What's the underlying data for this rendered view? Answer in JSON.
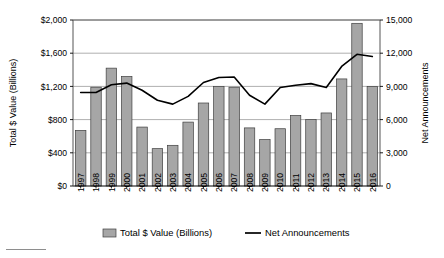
{
  "chart_data": {
    "type": "bar",
    "title": "",
    "subtitle": "",
    "xlabel": "",
    "ylabel": "Total $ Value (Billions)",
    "y2label": "Net Announcements",
    "grid": true,
    "legend_position": "bottom",
    "categories": [
      "1997",
      "1998",
      "1999",
      "2000",
      "2001",
      "2002",
      "2003",
      "2004",
      "2005",
      "2006",
      "2007",
      "2008",
      "2009",
      "2010",
      "2011",
      "2012",
      "2013",
      "2014",
      "2015",
      "2016"
    ],
    "ylim": [
      0,
      2000
    ],
    "yticks": [
      0,
      400,
      800,
      1200,
      1600,
      2000
    ],
    "ytick_labels": [
      "$0",
      "$400",
      "$800",
      "$1,200",
      "$1,600",
      "$2,000"
    ],
    "y2lim": [
      0,
      15000
    ],
    "y2ticks": [
      0,
      3000,
      6000,
      9000,
      12000,
      15000
    ],
    "y2tick_labels": [
      "0",
      "3,000",
      "6,000",
      "9,000",
      "12,000",
      "15,000"
    ],
    "series": [
      {
        "name": "Total $ Value (Billions)",
        "type": "bar",
        "axis": "left",
        "color": "#a6a6a6",
        "edge_color": "#3f3f3f",
        "values": [
          670,
          1190,
          1420,
          1320,
          710,
          450,
          490,
          770,
          1000,
          1200,
          1190,
          700,
          560,
          690,
          850,
          800,
          880,
          1290,
          1960,
          1200
        ]
      },
      {
        "name": "Net Announcements",
        "type": "line",
        "axis": "right",
        "color": "#000000",
        "values": [
          8450,
          8450,
          9150,
          9300,
          8650,
          7750,
          7400,
          8100,
          9350,
          9800,
          9850,
          8200,
          7400,
          8900,
          9100,
          9250,
          8900,
          10800,
          11900,
          11700
        ]
      }
    ]
  },
  "legend": {
    "items": [
      {
        "label": "Total $ Value (Billions)",
        "marker": "swatch",
        "color": "#a6a6a6"
      },
      {
        "label": "Net Announcements",
        "marker": "line",
        "color": "#000000"
      }
    ]
  },
  "colors": {
    "bar_fill": "#a6a6a6",
    "bar_edge": "#3f3f3f",
    "line": "#000000",
    "grid": "#9a9a9a",
    "axis": "#555555",
    "background": "#ffffff"
  }
}
